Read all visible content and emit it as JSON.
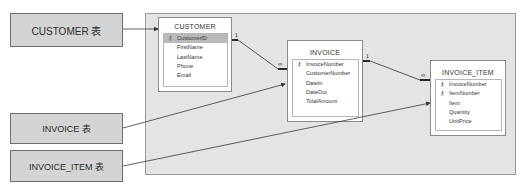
{
  "labels": [
    {
      "text": "CUSTOMER 表"
    },
    {
      "text": "INVOICE 表"
    },
    {
      "text": "INVOICE_ITEM 表"
    }
  ],
  "tables": {
    "customer": {
      "title": "CUSTOMER",
      "fields": [
        {
          "name": "CustomerID",
          "key": true,
          "selected": true
        },
        {
          "name": "FirstName"
        },
        {
          "name": "LastName"
        },
        {
          "name": "Phone"
        },
        {
          "name": "Email"
        }
      ]
    },
    "invoice": {
      "title": "INVOICE",
      "fields": [
        {
          "name": "InvoiceNumber",
          "key": true
        },
        {
          "name": "CustomerNumber"
        },
        {
          "name": "DateIn"
        },
        {
          "name": "DateOut"
        },
        {
          "name": "TotalAmount"
        }
      ]
    },
    "invoice_item": {
      "title": "INVOICE_ITEM",
      "fields": [
        {
          "name": "InvoiceNumber",
          "key": true
        },
        {
          "name": "ItemNumber",
          "key": true
        },
        {
          "name": "Item"
        },
        {
          "name": "Quantity"
        },
        {
          "name": "UnitPrice"
        }
      ]
    }
  },
  "relationships": [
    {
      "from": "CUSTOMER",
      "to": "INVOICE",
      "one": "1",
      "many": "∞"
    },
    {
      "from": "INVOICE",
      "to": "INVOICE_ITEM",
      "one": "1",
      "many": "∞"
    }
  ],
  "icons": {
    "key": "key-icon"
  },
  "colors": {
    "label_bg": "#d4d4d4",
    "canvas_bg": "#e4e4e4",
    "line": "#4a4a4a",
    "selected_row": "#b9b9b9"
  }
}
